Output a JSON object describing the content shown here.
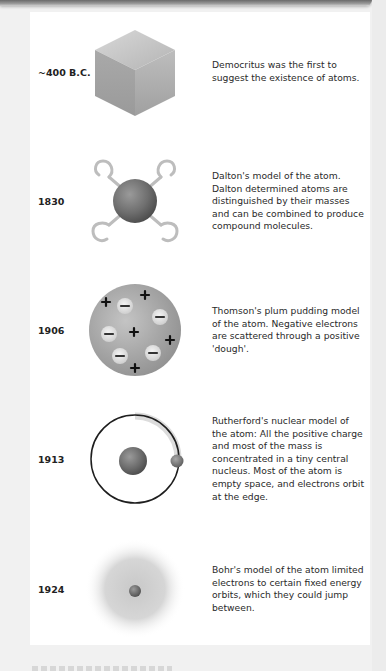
{
  "document": {
    "entries": [
      {
        "year": "~400 B.C.",
        "illustration": "cube-icon",
        "description": "Democritus was the first to suggest the existence of atoms."
      },
      {
        "year": "1830",
        "illustration": "dalton-atom-hooks-icon",
        "description": "Dalton's model of the atom. Dalton determined atoms are distinguished by their masses and can be combined to produce compound molecules."
      },
      {
        "year": "1906",
        "illustration": "plum-pudding-atom-icon",
        "description": "Thomson's plum pudding model of the atom. Negative electrons are scattered through a positive 'dough'."
      },
      {
        "year": "1913",
        "illustration": "rutherford-nucleus-orbit-icon",
        "description": "Rutherford's nuclear model of the atom: All the positive charge and most of the mass is concentrated in a tiny central nucleus. Most of the atom is empty space, and electrons orbit at the edge."
      },
      {
        "year": "1924",
        "illustration": "bohr-electron-cloud-icon",
        "description": "Bohr's model of the atom limited electrons to certain fixed energy orbits, which they could jump between."
      }
    ]
  },
  "colors": {
    "background": "#f1f1f1",
    "panel": "#ffffff",
    "text": "#222222",
    "sphere": "#7a7a7a",
    "hook": "#bdbdbd",
    "orbit": "#222222"
  }
}
